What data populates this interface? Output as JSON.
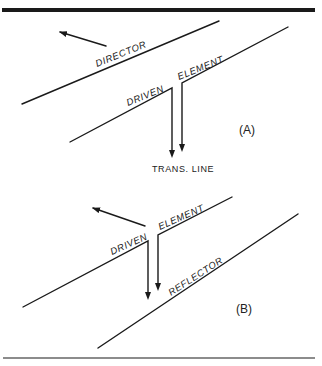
{
  "figure": {
    "panels": [
      {
        "id": "A",
        "label": "(A)",
        "elements": {
          "director": "DIRECTOR",
          "driven_left": "DRIVEN",
          "driven_right": "ELEMENT",
          "feed": "TRANS. LINE"
        }
      },
      {
        "id": "B",
        "label": "(B)",
        "elements": {
          "driven_left": "DRIVEN",
          "driven_right": "ELEMENT",
          "reflector": "REFLECTOR"
        }
      }
    ],
    "colors": {
      "ink": "#1a1a1a",
      "background": "#ffffff"
    }
  }
}
